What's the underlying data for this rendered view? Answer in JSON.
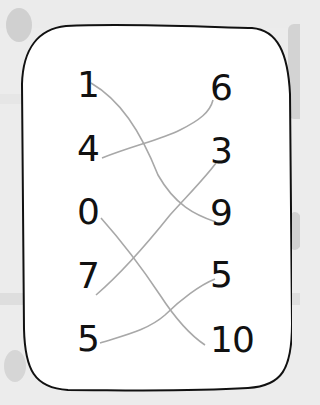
{
  "worksheet": {
    "type": "matching-exercise",
    "left_column": [
      {
        "label": "1"
      },
      {
        "label": "4"
      },
      {
        "label": "0"
      },
      {
        "label": "7"
      },
      {
        "label": "5"
      }
    ],
    "right_column": [
      {
        "label": "6"
      },
      {
        "label": "3"
      },
      {
        "label": "9"
      },
      {
        "label": "5"
      },
      {
        "label": "10"
      }
    ],
    "connections": [
      {
        "from": "1",
        "to": "9"
      },
      {
        "from": "4",
        "to": "6"
      },
      {
        "from": "0",
        "to": "10"
      },
      {
        "from": "7",
        "to": "3"
      },
      {
        "from": "5",
        "to": "5"
      }
    ],
    "colors": {
      "background": "#ececec",
      "card": "#ffffff",
      "border": "#111111",
      "pencil_line": "#a8a8a8",
      "numbers": "#111111"
    }
  }
}
